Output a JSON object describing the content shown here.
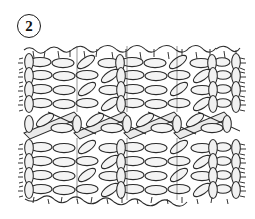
{
  "figure": {
    "label_number": "2",
    "label_shape": "circle",
    "caption": ""
  },
  "illustration": {
    "subject": "knitted-fabric-swatch",
    "style": "hand-drawn-line-art",
    "description": "Line drawing of a knitted fabric swatch showing rows of stitches with a diagonal cable twist band across the middle",
    "bounds": {
      "x": 23,
      "y": 44,
      "width": 217,
      "height": 159
    },
    "colors": {
      "stroke": "#2b2b2b",
      "fill_light": "#f2f2f2",
      "fill_band": "#e8e8e8",
      "background": "#ffffff"
    },
    "structure": {
      "rows": 10,
      "panels": 4,
      "cable_band_row_index": 4,
      "edge_fringe": "both-sides"
    }
  }
}
